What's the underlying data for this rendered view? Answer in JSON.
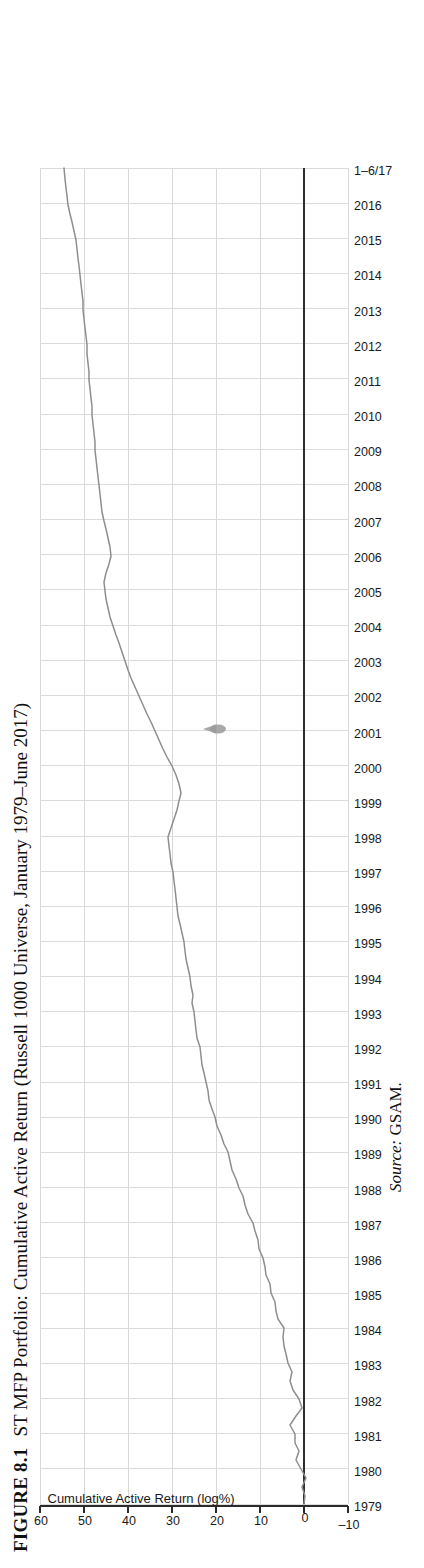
{
  "figure": {
    "number": "FIGURE 8.1",
    "caption": "ST MFP Portfolio: Cumulative Active Return (Russell 1000 Universe, January 1979–June 2017)",
    "source_label": "Source:",
    "source_value": "GSAM."
  },
  "chart_data": {
    "type": "line",
    "title": "ST MFP Portfolio: Cumulative Active Return (Russell 1000 Universe, January 1979–June 2017)",
    "xlabel": "",
    "ylabel": "Cumulative Active Return (log%)",
    "ylim": [
      -10,
      60
    ],
    "yticks": [
      -10,
      0,
      10,
      20,
      30,
      40,
      50,
      60
    ],
    "ytick_labels": [
      "–10",
      "0",
      "10",
      "20",
      "30",
      "40",
      "50",
      "60"
    ],
    "grid": true,
    "legend": null,
    "xtick_labels": [
      "1979",
      "1980",
      "1981",
      "1982",
      "1983",
      "1984",
      "1985",
      "1986",
      "1987",
      "1988",
      "1989",
      "1990",
      "1991",
      "1992",
      "1993",
      "1994",
      "1995",
      "1996",
      "1997",
      "1998",
      "1999",
      "2000",
      "2001",
      "2002",
      "2003",
      "2004",
      "2005",
      "2006",
      "2007",
      "2008",
      "2009",
      "2010",
      "2011",
      "2012",
      "2013",
      "2014",
      "2015",
      "2016",
      "1–6/17"
    ],
    "x": [
      "1979",
      "1980",
      "1981",
      "1982",
      "1983",
      "1984",
      "1985",
      "1986",
      "1987",
      "1988",
      "1989",
      "1990",
      "1991",
      "1992",
      "1993",
      "1994",
      "1995",
      "1996",
      "1997",
      "1998",
      "1999",
      "2000",
      "2001",
      "2002",
      "2003",
      "2004",
      "2005",
      "2006",
      "2007",
      "2008",
      "2009",
      "2010",
      "2011",
      "2012",
      "2013",
      "2014",
      "2015",
      "2016",
      "1–6/17"
    ],
    "series": [
      {
        "name": "Cumulative Active Return",
        "color": "#8e8e8e",
        "values": [
          0.0,
          0.6,
          2.0,
          1.2,
          3.6,
          4.6,
          6.5,
          7.6,
          9.3,
          11.0,
          12.5,
          14.6,
          17.2,
          18.4,
          19.6,
          20.2,
          21.0,
          22.4,
          23.2,
          23.8,
          23.0,
          24.6,
          27.4,
          29.8,
          32.6,
          35.4,
          38.6,
          41.6,
          43.0,
          44.8,
          45.6,
          46.4,
          47.8,
          48.4,
          49.4,
          50.4,
          51.6,
          53.2,
          54.0
        ]
      }
    ],
    "annotations": [
      {
        "name": "ink-smudge",
        "shape": "teardrop",
        "x_year": "2004",
        "y_value": 19.5
      }
    ]
  },
  "axis": {
    "y_title": "Cumulative Active Return (log%)"
  }
}
